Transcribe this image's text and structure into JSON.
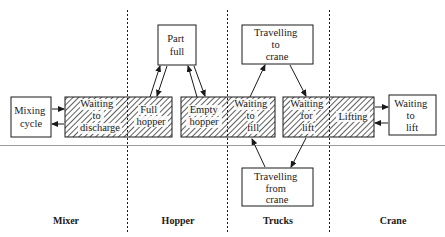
{
  "diagram": {
    "title": "",
    "columns": [
      {
        "id": "mixer",
        "label": "Mixer",
        "x": 66
      },
      {
        "id": "hopper",
        "label": "Hopper",
        "x": 178
      },
      {
        "id": "trucks",
        "label": "Trucks",
        "x": 278
      },
      {
        "id": "crane",
        "label": "Crane",
        "x": 393
      }
    ],
    "dividers_x": [
      127,
      227,
      329
    ],
    "states": {
      "mixing_cycle": {
        "lines": [
          "Mixing",
          "cycle"
        ],
        "type": "active"
      },
      "waiting_to_discharge": {
        "lines": [
          "Waiting",
          "to",
          "discharge"
        ],
        "type": "queue"
      },
      "full_hopper": {
        "lines": [
          "Full",
          "hopper"
        ],
        "type": "queue"
      },
      "part_full": {
        "lines": [
          "Part",
          "full"
        ],
        "type": "active"
      },
      "empty_hopper": {
        "lines": [
          "Empty",
          "hopper"
        ],
        "type": "queue"
      },
      "waiting_to_fill": {
        "lines": [
          "Waiting",
          "to",
          "fill"
        ],
        "type": "queue"
      },
      "travelling_to_crane": {
        "lines": [
          "Travelling",
          "to",
          "crane"
        ],
        "type": "active"
      },
      "waiting_for_lift": {
        "lines": [
          "Waiting",
          "for",
          "lift"
        ],
        "type": "queue"
      },
      "travelling_from_crane": {
        "lines": [
          "Travelling",
          "from",
          "crane"
        ],
        "type": "active"
      },
      "lifting": {
        "lines": [
          "Lifting"
        ],
        "type": "queue"
      },
      "waiting_to_lift": {
        "lines": [
          "Waiting",
          "to",
          "lift"
        ],
        "type": "active"
      }
    },
    "transitions": [
      {
        "from": "mixing_cycle",
        "to": "waiting_to_discharge"
      },
      {
        "from": "waiting_to_discharge",
        "to": "mixing_cycle"
      },
      {
        "from": "full_hopper",
        "to": "part_full"
      },
      {
        "from": "part_full",
        "to": "full_hopper"
      },
      {
        "from": "empty_hopper",
        "to": "part_full"
      },
      {
        "from": "part_full",
        "to": "empty_hopper"
      },
      {
        "from": "waiting_to_fill",
        "to": "travelling_to_crane"
      },
      {
        "from": "travelling_to_crane",
        "to": "waiting_for_lift"
      },
      {
        "from": "waiting_for_lift",
        "to": "travelling_from_crane"
      },
      {
        "from": "travelling_from_crane",
        "to": "waiting_to_fill"
      },
      {
        "from": "lifting",
        "to": "waiting_to_lift"
      },
      {
        "from": "waiting_to_lift",
        "to": "lifting"
      }
    ],
    "colors": {
      "ink": "#1a1a1a",
      "rule": "#9a9a9a",
      "background": "#ffffff"
    }
  }
}
